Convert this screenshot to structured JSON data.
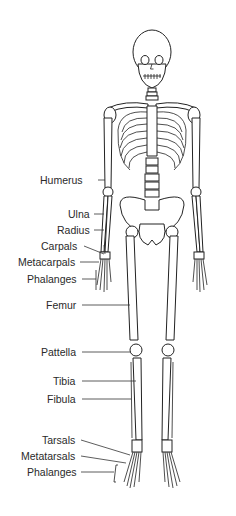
{
  "diagram": {
    "text_color": "#2a2a2a",
    "line_color": "#333333",
    "labels": [
      {
        "id": "humerus",
        "text": "Humerus",
        "x": 56,
        "y": 173,
        "tx": 86,
        "ty": 180
      },
      {
        "id": "ulna",
        "text": "Ulna",
        "x": 83,
        "y": 207,
        "tx": 108,
        "ty": 214
      },
      {
        "id": "radius",
        "text": "Radius",
        "x": 82,
        "y": 223,
        "tx": 106,
        "ty": 230
      },
      {
        "id": "carpals",
        "text": "Carpals",
        "x": 84,
        "y": 239,
        "tx": 106,
        "ty": 254
      },
      {
        "id": "metacarpals",
        "text": "Metacarpals",
        "x": 19,
        "y": 256,
        "tx": 99,
        "ty": 262
      },
      {
        "id": "phalanges-hand",
        "text": "Phalanges",
        "x": 28,
        "y": 272,
        "tx": 96,
        "ty": 279
      },
      {
        "id": "femur",
        "text": "Femur",
        "x": 46,
        "y": 298,
        "tx": 129,
        "ty": 305
      },
      {
        "id": "pattella",
        "text": "Pattella",
        "x": 41,
        "y": 344,
        "tx": 132,
        "ty": 352
      },
      {
        "id": "tibia",
        "text": "Tibia",
        "x": 53,
        "y": 373,
        "tx": 136,
        "ty": 381
      },
      {
        "id": "fibula",
        "text": "Fibula",
        "x": 47,
        "y": 391,
        "tx": 130,
        "ty": 399
      },
      {
        "id": "tarsals",
        "text": "Tarsals",
        "x": 42,
        "y": 433,
        "tx": 130,
        "ty": 455
      },
      {
        "id": "metatarsals",
        "text": "Metatarsals",
        "x": 22,
        "y": 449,
        "tx": 126,
        "ty": 463
      },
      {
        "id": "phalanges-foot",
        "text": "Phalanges",
        "x": 27,
        "y": 465,
        "tx": 112,
        "ty": 472
      }
    ]
  }
}
